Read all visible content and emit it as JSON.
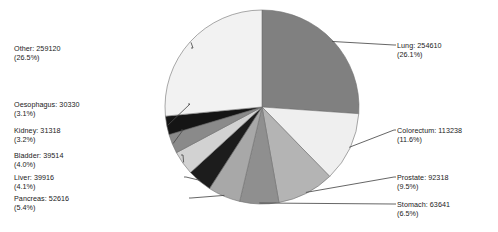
{
  "chart_data": {
    "type": "pie",
    "title": "",
    "subtitle": "",
    "xlabel": "",
    "ylabel": "",
    "legend_position": "none",
    "grid": false,
    "total": 977421,
    "categories": [
      "Lung",
      "Colorectum",
      "Prostate",
      "Stomach",
      "Pancreas",
      "Liver",
      "Bladder",
      "Kidney",
      "Oesophagus",
      "Other"
    ],
    "values": [
      254610,
      113238,
      92318,
      63641,
      52616,
      39916,
      39514,
      31318,
      30330,
      259120
    ],
    "percentages": [
      26.1,
      11.6,
      9.5,
      6.5,
      5.4,
      4.1,
      4.0,
      3.2,
      3.1,
      26.5
    ],
    "slices": [
      {
        "label": "Lung",
        "value": "254610",
        "value_text": "Lung: 254610",
        "percent_text": "(26.1%)",
        "percent": 26.1,
        "color": "#808080",
        "side": "right"
      },
      {
        "label": "Colorectum",
        "value": "113238",
        "value_text": "Colorectum: 113238",
        "percent_text": "(11.6%)",
        "percent": 11.6,
        "color": "#efefef",
        "side": "right"
      },
      {
        "label": "Prostate",
        "value": "92318",
        "value_text": "Prostate: 92318",
        "percent_text": "(9.5%)",
        "percent": 9.5,
        "color": "#b4b4b4",
        "side": "right"
      },
      {
        "label": "Stomach",
        "value": "63641",
        "value_text": "Stomach: 63641",
        "percent_text": "(6.5%)",
        "percent": 6.5,
        "color": "#8f8f8f",
        "side": "right"
      },
      {
        "label": "Pancreas",
        "value": "52616",
        "value_text": "Pancreas: 52616",
        "percent_text": "(5.4%)",
        "percent": 5.4,
        "color": "#a8a8a8",
        "side": "left"
      },
      {
        "label": "Liver",
        "value": "39916",
        "value_text": "Liver: 39916",
        "percent_text": "(4.1%)",
        "percent": 4.1,
        "color": "#1c1c1c",
        "side": "left"
      },
      {
        "label": "Bladder",
        "value": "39514",
        "value_text": "Bladder: 39514",
        "percent_text": "(4.0%)",
        "percent": 4.0,
        "color": "#d2d2d2",
        "side": "left"
      },
      {
        "label": "Kidney",
        "value": "31318",
        "value_text": "Kidney: 31318",
        "percent_text": "(3.2%)",
        "percent": 3.2,
        "color": "#8a8a8a",
        "side": "left"
      },
      {
        "label": "Oesophagus",
        "value": "30330",
        "value_text": "Oesophagus: 30330",
        "percent_text": "(3.1%)",
        "percent": 3.1,
        "color": "#151515",
        "side": "left"
      },
      {
        "label": "Other",
        "value": "259120",
        "value_text": "Other: 259120",
        "percent_text": "(26.5%)",
        "percent": 26.5,
        "color": "#f2f2f2",
        "side": "left"
      }
    ],
    "geometry": {
      "cx": 262,
      "cy": 107,
      "r": 97,
      "start_angle_deg": -90,
      "direction": "clockwise"
    },
    "stroke_color": "#707070",
    "leader_color": "#4a4a4a"
  }
}
